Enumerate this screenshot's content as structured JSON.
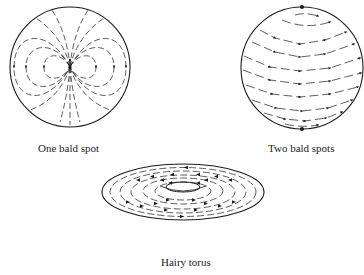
{
  "figure": {
    "panels": [
      {
        "id": "one-bald-spot",
        "caption": "One bald spot",
        "shape": "sphere",
        "bald_spots": 1
      },
      {
        "id": "two-bald-spots",
        "caption": "Two bald spots",
        "shape": "sphere",
        "bald_spots": 2
      },
      {
        "id": "hairy-torus",
        "caption": "Hairy torus",
        "shape": "torus",
        "bald_spots": 0
      }
    ],
    "colors": {
      "ink": "#1a1a1a",
      "background": "#ffffff"
    }
  }
}
